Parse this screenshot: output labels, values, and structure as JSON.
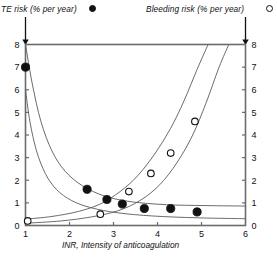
{
  "legend": {
    "te": {
      "label": "TE risk (% per year)",
      "marker": "filled-circle",
      "color": "#111111"
    },
    "bleeding": {
      "label": "Bleeding risk (% per year)",
      "marker": "open-circle",
      "color": "#111111"
    }
  },
  "axes": {
    "x_title": "INR, Intensity of anticoagulation",
    "x_ticks": [
      "1",
      "2",
      "3",
      "4",
      "5",
      "6"
    ],
    "y_left_ticks": [
      "0",
      "1",
      "2",
      "3",
      "4",
      "5",
      "6",
      "7",
      "8"
    ],
    "y_right_ticks": [
      "0",
      "1",
      "2",
      "3",
      "4",
      "5",
      "6",
      "7",
      "8"
    ]
  },
  "chart_data": {
    "type": "scatter",
    "title": "",
    "subtitle": "",
    "xlabel": "INR, Intensity of anticoagulation",
    "ylabel": "TE risk (% per year)",
    "y2label": "Bleeding risk (% per year)",
    "xlim": [
      1,
      6
    ],
    "ylim": [
      0,
      8
    ],
    "y2lim": [
      0,
      8
    ],
    "xticks": [
      1,
      2,
      3,
      4,
      5,
      6
    ],
    "yticks": [
      0,
      1,
      2,
      3,
      4,
      5,
      6,
      7,
      8
    ],
    "grid": false,
    "legend_position": "top",
    "series": [
      {
        "name": "TE risk (% per year)",
        "marker": "filled-circle",
        "axis": "left",
        "points": [
          {
            "x": 1.0,
            "y": 7.0
          },
          {
            "x": 2.4,
            "y": 1.6
          },
          {
            "x": 2.85,
            "y": 1.15
          },
          {
            "x": 3.2,
            "y": 0.95
          },
          {
            "x": 3.7,
            "y": 0.75
          },
          {
            "x": 4.3,
            "y": 0.75
          },
          {
            "x": 4.9,
            "y": 0.6
          }
        ]
      },
      {
        "name": "Bleeding risk (% per year)",
        "marker": "open-circle",
        "axis": "right",
        "points": [
          {
            "x": 1.05,
            "y": 0.2
          },
          {
            "x": 2.7,
            "y": 0.5
          },
          {
            "x": 3.35,
            "y": 1.5
          },
          {
            "x": 3.85,
            "y": 2.3
          },
          {
            "x": 4.3,
            "y": 3.2
          },
          {
            "x": 4.85,
            "y": 4.6
          }
        ]
      }
    ],
    "curves": [
      {
        "name": "te-upper-bound",
        "kind": "decreasing",
        "points": [
          {
            "x": 1.0,
            "y": 8.0
          },
          {
            "x": 1.15,
            "y": 6.3
          },
          {
            "x": 1.35,
            "y": 4.6
          },
          {
            "x": 1.6,
            "y": 3.3
          },
          {
            "x": 1.9,
            "y": 2.4
          },
          {
            "x": 2.3,
            "y": 1.75
          },
          {
            "x": 2.8,
            "y": 1.3
          },
          {
            "x": 3.4,
            "y": 1.05
          },
          {
            "x": 4.2,
            "y": 0.92
          },
          {
            "x": 5.1,
            "y": 0.88
          },
          {
            "x": 6.0,
            "y": 0.86
          }
        ]
      },
      {
        "name": "te-lower-bound",
        "kind": "decreasing",
        "points": [
          {
            "x": 1.0,
            "y": 6.0
          },
          {
            "x": 1.1,
            "y": 4.6
          },
          {
            "x": 1.25,
            "y": 3.3
          },
          {
            "x": 1.45,
            "y": 2.3
          },
          {
            "x": 1.7,
            "y": 1.6
          },
          {
            "x": 2.05,
            "y": 1.1
          },
          {
            "x": 2.5,
            "y": 0.78
          },
          {
            "x": 3.1,
            "y": 0.56
          },
          {
            "x": 3.9,
            "y": 0.42
          },
          {
            "x": 4.9,
            "y": 0.34
          },
          {
            "x": 6.0,
            "y": 0.3
          }
        ]
      },
      {
        "name": "bleeding-upper-bound",
        "kind": "increasing",
        "points": [
          {
            "x": 1.0,
            "y": 0.28
          },
          {
            "x": 1.6,
            "y": 0.4
          },
          {
            "x": 2.2,
            "y": 0.62
          },
          {
            "x": 2.7,
            "y": 0.95
          },
          {
            "x": 3.15,
            "y": 1.5
          },
          {
            "x": 3.55,
            "y": 2.2
          },
          {
            "x": 3.95,
            "y": 3.2
          },
          {
            "x": 4.3,
            "y": 4.3
          },
          {
            "x": 4.6,
            "y": 5.5
          },
          {
            "x": 4.9,
            "y": 6.9
          },
          {
            "x": 5.15,
            "y": 8.0
          }
        ]
      },
      {
        "name": "bleeding-lower-bound",
        "kind": "increasing",
        "points": [
          {
            "x": 1.0,
            "y": 0.1
          },
          {
            "x": 1.8,
            "y": 0.2
          },
          {
            "x": 2.5,
            "y": 0.38
          },
          {
            "x": 3.1,
            "y": 0.65
          },
          {
            "x": 3.6,
            "y": 1.1
          },
          {
            "x": 4.05,
            "y": 1.8
          },
          {
            "x": 4.45,
            "y": 2.8
          },
          {
            "x": 4.8,
            "y": 4.0
          },
          {
            "x": 5.1,
            "y": 5.4
          },
          {
            "x": 5.4,
            "y": 7.0
          },
          {
            "x": 5.62,
            "y": 8.0
          }
        ]
      }
    ]
  }
}
